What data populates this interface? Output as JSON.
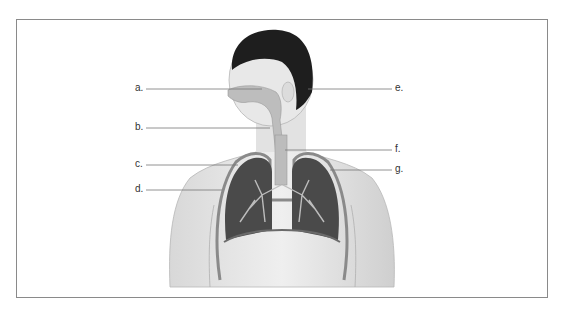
{
  "diagram": {
    "type": "anatomical-label-diagram",
    "labels_left": [
      {
        "id": "a",
        "text": "a."
      },
      {
        "id": "b",
        "text": "b."
      },
      {
        "id": "c",
        "text": "c."
      },
      {
        "id": "d",
        "text": "d."
      }
    ],
    "labels_right": [
      {
        "id": "e",
        "text": "e."
      },
      {
        "id": "f",
        "text": "f."
      },
      {
        "id": "g",
        "text": "g."
      }
    ],
    "colors": {
      "frame": "#8a8a8a",
      "skin": "#e4e4e4",
      "hair": "#1e1e1e",
      "lung": "#4a4a4a",
      "bronchi": "#bdbdbd",
      "leader": "#777777"
    }
  }
}
